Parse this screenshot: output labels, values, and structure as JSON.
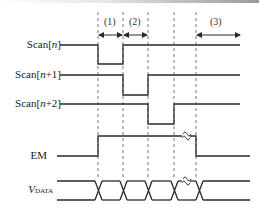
{
  "diagram": {
    "type": "timing-diagram",
    "signals": [
      {
        "id": "scan_n",
        "label_main": "Scan[",
        "label_var": "n",
        "label_end": "]"
      },
      {
        "id": "scan_n1",
        "label_main": "Scan[",
        "label_var": "n",
        "label_end": "+1]"
      },
      {
        "id": "scan_n2",
        "label_main": "Scan[",
        "label_var": "n",
        "label_end": "+2]"
      },
      {
        "id": "em",
        "label_main": "EM"
      },
      {
        "id": "vdata",
        "label_main": "V",
        "label_sub": "DATA"
      }
    ],
    "periods": [
      {
        "id": "p1",
        "label": "(1)"
      },
      {
        "id": "p2",
        "label": "(2)"
      },
      {
        "id": "p3",
        "label": "(3)"
      }
    ],
    "break_mark": "≈",
    "colors": {
      "line": "#2a2a2a",
      "dash": "#777777"
    }
  }
}
